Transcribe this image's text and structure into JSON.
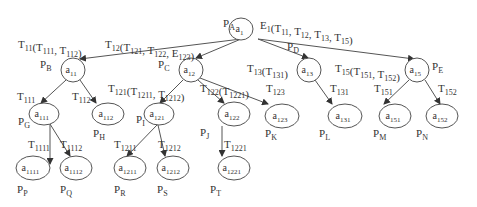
{
  "colors": {
    "line": "#555555",
    "text": "#333333",
    "background": "#ffffff"
  },
  "nodes": [
    {
      "id": "a1",
      "main": "a",
      "sub": "1",
      "cx": 241,
      "cy": 29,
      "rx": 12,
      "ry": 11,
      "place": "P",
      "place_sub": "A",
      "px": 223,
      "py": 27
    },
    {
      "id": "a11",
      "main": "a",
      "sub": "11",
      "cx": 73,
      "cy": 70,
      "rx": 12,
      "ry": 12,
      "place": "P",
      "place_sub": "B",
      "px": 40,
      "py": 68
    },
    {
      "id": "a12",
      "main": "a",
      "sub": "12",
      "cx": 191,
      "cy": 70,
      "rx": 12,
      "ry": 12,
      "place": "P",
      "place_sub": "C",
      "px": 158,
      "py": 68
    },
    {
      "id": "a13",
      "main": "a",
      "sub": "13",
      "cx": 309,
      "cy": 70,
      "rx": 12,
      "ry": 12,
      "place": "P",
      "place_sub": "D",
      "px": 287,
      "py": 50
    },
    {
      "id": "a15",
      "main": "a",
      "sub": "15",
      "cx": 417,
      "cy": 70,
      "rx": 12,
      "ry": 12,
      "place": "P",
      "place_sub": "E",
      "px": 432,
      "py": 70
    },
    {
      "id": "a111",
      "main": "a",
      "sub": "111",
      "cx": 44,
      "cy": 114,
      "rx": 15,
      "ry": 11,
      "place": "P",
      "place_sub": "G",
      "px": 18,
      "py": 125
    },
    {
      "id": "a112",
      "main": "a",
      "sub": "112",
      "cx": 108,
      "cy": 114,
      "rx": 16,
      "ry": 11,
      "place": "P",
      "place_sub": "H",
      "px": 93,
      "py": 137
    },
    {
      "id": "a121",
      "main": "a",
      "sub": "121",
      "cx": 159,
      "cy": 114,
      "rx": 15,
      "ry": 11,
      "place": "P",
      "place_sub": "I",
      "px": 136,
      "py": 123
    },
    {
      "id": "a122",
      "main": "a",
      "sub": "122",
      "cx": 234,
      "cy": 114,
      "rx": 16,
      "ry": 12,
      "place": "P",
      "place_sub": "J",
      "px": 200,
      "py": 136
    },
    {
      "id": "a123",
      "main": "a",
      "sub": "123",
      "cx": 282,
      "cy": 116,
      "rx": 17,
      "ry": 12,
      "place": "P",
      "place_sub": "K",
      "px": 265,
      "py": 137
    },
    {
      "id": "a131",
      "main": "a",
      "sub": "131",
      "cx": 345,
      "cy": 116,
      "rx": 17,
      "ry": 12,
      "place": "P",
      "place_sub": "L",
      "px": 319,
      "py": 137
    },
    {
      "id": "a151",
      "main": "a",
      "sub": "151",
      "cx": 395,
      "cy": 116,
      "rx": 16,
      "ry": 12,
      "place": "P",
      "place_sub": "M",
      "px": 373,
      "py": 137
    },
    {
      "id": "a152",
      "main": "a",
      "sub": "152",
      "cx": 442,
      "cy": 116,
      "rx": 16,
      "ry": 12,
      "place": "P",
      "place_sub": "N",
      "px": 416,
      "py": 137
    },
    {
      "id": "a1111",
      "main": "a",
      "sub": "1111",
      "cx": 33,
      "cy": 168,
      "rx": 17,
      "ry": 12,
      "place": "P",
      "place_sub": "P",
      "px": 17,
      "py": 193
    },
    {
      "id": "a1112",
      "main": "a",
      "sub": "1112",
      "cx": 76,
      "cy": 168,
      "rx": 16,
      "ry": 12,
      "place": "P",
      "place_sub": "Q",
      "px": 60,
      "py": 193
    },
    {
      "id": "a1211",
      "main": "a",
      "sub": "1211",
      "cx": 130,
      "cy": 168,
      "rx": 16,
      "ry": 12,
      "place": "P",
      "place_sub": "R",
      "px": 114,
      "py": 193
    },
    {
      "id": "a1212",
      "main": "a",
      "sub": "1212",
      "cx": 173,
      "cy": 168,
      "rx": 16,
      "ry": 12,
      "place": "P",
      "place_sub": "S",
      "px": 157,
      "py": 193
    },
    {
      "id": "a1221",
      "main": "a",
      "sub": "1221",
      "cx": 234,
      "cy": 168,
      "rx": 16,
      "ry": 12,
      "place": "P",
      "place_sub": "T",
      "px": 210,
      "py": 193
    }
  ],
  "edges": [
    {
      "from": "a1",
      "to": "a11",
      "x1": 241,
      "y1": 39,
      "x2": 80,
      "y2": 59
    },
    {
      "from": "a1",
      "to": "a12",
      "x1": 241,
      "y1": 39,
      "x2": 196,
      "y2": 58
    },
    {
      "from": "a1",
      "to": "a13",
      "x1": 258,
      "y1": 39,
      "x2": 308,
      "y2": 58
    },
    {
      "from": "a1",
      "to": "a15",
      "x1": 258,
      "y1": 39,
      "x2": 414,
      "y2": 59
    },
    {
      "from": "a11",
      "to": "a111",
      "x1": 66,
      "y1": 80,
      "x2": 41,
      "y2": 103
    },
    {
      "from": "a11",
      "to": "a112",
      "x1": 80,
      "y1": 80,
      "x2": 96,
      "y2": 103
    },
    {
      "from": "a12",
      "to": "a121",
      "x1": 183,
      "y1": 80,
      "x2": 160,
      "y2": 103
    },
    {
      "from": "a12",
      "to": "a122",
      "x1": 198,
      "y1": 80,
      "x2": 224,
      "y2": 103
    },
    {
      "from": "a12",
      "to": "a123",
      "x1": 200,
      "y1": 78,
      "x2": 268,
      "y2": 104
    },
    {
      "from": "a13",
      "to": "a131",
      "x1": 315,
      "y1": 80,
      "x2": 332,
      "y2": 104
    },
    {
      "from": "a15",
      "to": "a151",
      "x1": 409,
      "y1": 80,
      "x2": 384,
      "y2": 104
    },
    {
      "from": "a15",
      "to": "a152",
      "x1": 425,
      "y1": 80,
      "x2": 440,
      "y2": 104
    },
    {
      "from": "a111",
      "to": "a1111",
      "x1": 50,
      "y1": 124,
      "x2": 50,
      "y2": 164
    },
    {
      "from": "a111",
      "to": "a1112",
      "x1": 50,
      "y1": 124,
      "x2": 70,
      "y2": 156
    },
    {
      "from": "a121",
      "to": "a1211",
      "x1": 157,
      "y1": 125,
      "x2": 127,
      "y2": 156
    },
    {
      "from": "a121",
      "to": "a1212",
      "x1": 158,
      "y1": 125,
      "x2": 165,
      "y2": 156
    },
    {
      "from": "a122",
      "to": "a1221",
      "x1": 222,
      "y1": 126,
      "x2": 222,
      "y2": 156
    }
  ],
  "labels": [
    {
      "id": "E1",
      "text": "E",
      "sub": "1",
      "rest": "(T11, T12, T13, T15)",
      "x": 260,
      "y": 29,
      "parts": [
        [
          "E",
          "1"
        ],
        [
          "(T",
          ""
        ],
        [
          "",
          "11"
        ],
        [
          ", T",
          ""
        ],
        [
          "",
          "12"
        ],
        [
          ", T",
          ""
        ],
        [
          "",
          "13"
        ],
        [
          ", T",
          ""
        ],
        [
          "",
          "15"
        ],
        [
          ")",
          ""
        ]
      ]
    },
    {
      "id": "T11",
      "x": 18,
      "y": 48,
      "parts": [
        [
          "T",
          "11"
        ],
        [
          "(T",
          "111"
        ],
        [
          ", T",
          "112"
        ],
        [
          ")",
          ""
        ]
      ]
    },
    {
      "id": "T12",
      "x": 105,
      "y": 48,
      "parts": [
        [
          "T",
          "12"
        ],
        [
          "(T",
          "121"
        ],
        [
          ", T",
          "122"
        ],
        [
          ", E",
          "123"
        ],
        [
          ")",
          ""
        ]
      ]
    },
    {
      "id": "T13",
      "x": 247,
      "y": 72,
      "parts": [
        [
          "T",
          "13"
        ],
        [
          "(T",
          "131"
        ],
        [
          ")",
          ""
        ]
      ]
    },
    {
      "id": "T15",
      "x": 335,
      "y": 72,
      "parts": [
        [
          "T",
          "15"
        ],
        [
          "(T",
          "151"
        ],
        [
          ", T",
          "152"
        ],
        [
          ")",
          ""
        ]
      ]
    },
    {
      "id": "T111",
      "x": 17,
      "y": 100,
      "parts": [
        [
          "T",
          "111"
        ]
      ]
    },
    {
      "id": "T112",
      "x": 72,
      "y": 100,
      "parts": [
        [
          "T",
          "112"
        ]
      ]
    },
    {
      "id": "T121",
      "x": 108,
      "y": 92,
      "parts": [
        [
          "T",
          "121"
        ],
        [
          "(T",
          "1211"
        ],
        [
          ", T",
          "1212"
        ],
        [
          ")",
          ""
        ]
      ]
    },
    {
      "id": "T122",
      "x": 200,
      "y": 92,
      "parts": [
        [
          "T",
          "122"
        ],
        [
          "(T",
          "1221"
        ],
        [
          ")",
          ""
        ]
      ]
    },
    {
      "id": "T123",
      "x": 266,
      "y": 92,
      "parts": [
        [
          "T",
          "123"
        ]
      ]
    },
    {
      "id": "T131",
      "x": 330,
      "y": 92,
      "parts": [
        [
          "T",
          "131"
        ]
      ]
    },
    {
      "id": "T151",
      "x": 374,
      "y": 92,
      "parts": [
        [
          "T",
          "151"
        ]
      ]
    },
    {
      "id": "T152",
      "x": 438,
      "y": 92,
      "parts": [
        [
          "T",
          "152"
        ]
      ]
    },
    {
      "id": "T1111",
      "x": 28,
      "y": 148,
      "parts": [
        [
          "T",
          "1111"
        ]
      ]
    },
    {
      "id": "T1112",
      "x": 60,
      "y": 148,
      "parts": [
        [
          "T",
          "1112"
        ]
      ]
    },
    {
      "id": "T1211",
      "x": 114,
      "y": 148,
      "parts": [
        [
          "T",
          "1211"
        ]
      ]
    },
    {
      "id": "T1212",
      "x": 158,
      "y": 148,
      "parts": [
        [
          "T",
          "1212"
        ]
      ]
    },
    {
      "id": "T1221",
      "x": 224,
      "y": 148,
      "parts": [
        [
          "T",
          "1221"
        ]
      ]
    }
  ]
}
